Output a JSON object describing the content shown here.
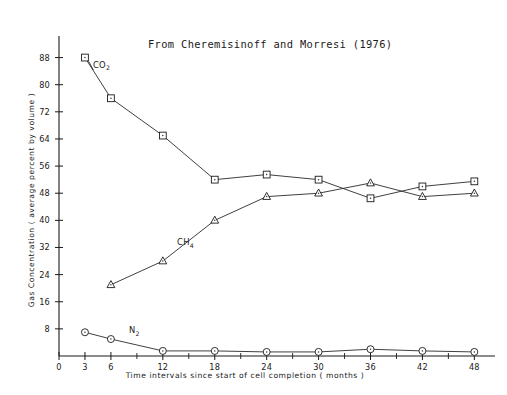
{
  "chart_data": {
    "type": "line",
    "title": "From Cheremisinoff and Morresi (1976)",
    "xlabel": "Time  intervals  since  start  of  cell  completion   ( months )",
    "ylabel": "Gas  Concentration  ( average  percent  by  volume )",
    "x": [
      3,
      6,
      12,
      18,
      24,
      30,
      36,
      42,
      48
    ],
    "xlim": [
      0,
      49
    ],
    "ylim": [
      0,
      92
    ],
    "xticks": [
      0,
      3,
      6,
      12,
      18,
      24,
      30,
      36,
      42,
      48
    ],
    "xtick_labels": [
      "0",
      "3",
      "6",
      "12",
      "18",
      "24",
      "30",
      "36",
      "42",
      "48"
    ],
    "xticks_minor": [
      9,
      15,
      21,
      27,
      33,
      39,
      45
    ],
    "yticks": [
      8,
      16,
      24,
      32,
      40,
      48,
      56,
      64,
      72,
      80,
      88
    ],
    "ytick_labels": [
      "8",
      "16",
      "24",
      "32",
      "40",
      "48",
      "56",
      "64",
      "72",
      "80",
      "88"
    ],
    "grid": false,
    "legend": "inline-annotations",
    "series": [
      {
        "name": "CO2",
        "label_main": "CO",
        "label_sub": "2",
        "marker": "square",
        "values": [
          88.0,
          76.0,
          65.0,
          52.0,
          53.5,
          52.0,
          46.5,
          50.0,
          51.5
        ]
      },
      {
        "name": "CH4",
        "label_main": "CH",
        "label_sub": "4",
        "marker": "triangle",
        "values": [
          null,
          21.0,
          28.0,
          40.0,
          47.0,
          48.0,
          51.0,
          47.0,
          48.0
        ]
      },
      {
        "name": "N2",
        "label_main": "N",
        "label_sub": "2",
        "marker": "circle",
        "values": [
          7.0,
          5.0,
          1.5,
          1.5,
          1.2,
          1.2,
          2.0,
          1.5,
          1.2
        ]
      }
    ]
  },
  "colors": {
    "ink": "#1a1a1a",
    "line": "#2a2a2a",
    "background": "#ffffff"
  }
}
